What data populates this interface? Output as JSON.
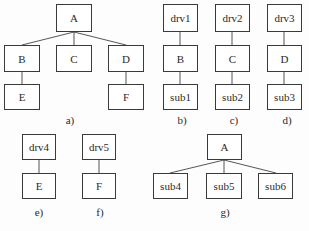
{
  "diagrams": {
    "a": {
      "caption": "a)",
      "nodes": {
        "A": "A",
        "B": "B",
        "C": "C",
        "D": "D",
        "E": "E",
        "F": "F"
      },
      "edges": [
        [
          "A",
          "B"
        ],
        [
          "A",
          "C"
        ],
        [
          "A",
          "D"
        ],
        [
          "B",
          "E"
        ],
        [
          "D",
          "F"
        ]
      ]
    },
    "b": {
      "caption": "b)",
      "nodes": {
        "top": "drv1",
        "mid": "B",
        "bottom": "sub1"
      }
    },
    "c": {
      "caption": "c)",
      "nodes": {
        "top": "drv2",
        "mid": "C",
        "bottom": "sub2"
      }
    },
    "d": {
      "caption": "d)",
      "nodes": {
        "top": "drv3",
        "mid": "D",
        "bottom": "sub3"
      }
    },
    "e": {
      "caption": "e)",
      "nodes": {
        "top": "drv4",
        "bottom": "E"
      }
    },
    "f": {
      "caption": "f)",
      "nodes": {
        "top": "drv5",
        "bottom": "F"
      }
    },
    "g": {
      "caption": "g)",
      "nodes": {
        "root": "A",
        "c1": "sub4",
        "c2": "sub5",
        "c3": "sub6"
      },
      "edges": [
        [
          "A",
          "sub4"
        ],
        [
          "A",
          "sub5"
        ],
        [
          "A",
          "sub6"
        ]
      ]
    }
  }
}
